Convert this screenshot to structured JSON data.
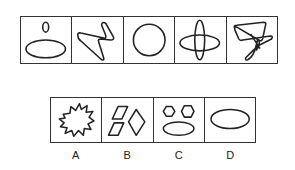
{
  "puzzle": {
    "question_figures": [
      {
        "index": 1,
        "icon": "small-oval-above-large-ellipse-icon"
      },
      {
        "index": 2,
        "icon": "single-stroke-loop-icon"
      },
      {
        "index": 3,
        "icon": "circle-icon"
      },
      {
        "index": 4,
        "icon": "crossed-ellipses-icon"
      },
      {
        "index": 5,
        "icon": "tangled-line-icon"
      }
    ],
    "options": [
      {
        "label": "A",
        "icon": "starburst-icon"
      },
      {
        "label": "B",
        "icon": "parallelograms-and-rhombus-icon"
      },
      {
        "label": "C",
        "icon": "two-hexagons-and-ellipse-icon"
      },
      {
        "label": "D",
        "icon": "ellipse-icon"
      }
    ]
  }
}
